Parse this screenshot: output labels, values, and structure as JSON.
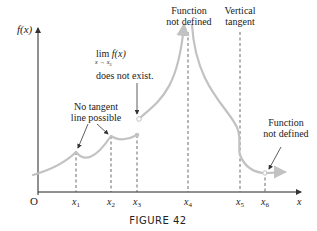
{
  "figure": {
    "caption": "FIGURE 42",
    "y_axis_label": "f(x)",
    "x_axis_label": "x",
    "origin_label": "O",
    "colors": {
      "curve": "#c2c2c2",
      "axis": "#222222",
      "text": "#222222"
    }
  },
  "x_ticks": [
    {
      "label": "x",
      "sub": "1"
    },
    {
      "label": "x",
      "sub": "2"
    },
    {
      "label": "x",
      "sub": "3"
    },
    {
      "label": "x",
      "sub": "4"
    },
    {
      "label": "x",
      "sub": "5"
    },
    {
      "label": "x",
      "sub": "6"
    }
  ],
  "annotations": {
    "no_tangent": {
      "line1": "No tangent",
      "line2": "line possible"
    },
    "limit": {
      "lim": "lim",
      "func": "f(x)",
      "under": "x → x",
      "under_sub": "3",
      "text": "does not exist."
    },
    "not_defined_top": {
      "line1": "Function",
      "line2": "not defined"
    },
    "vertical_tangent": {
      "line1": "Vertical",
      "line2": "tangent"
    },
    "not_defined_right": {
      "line1": "Function",
      "line2": "not defined"
    }
  }
}
